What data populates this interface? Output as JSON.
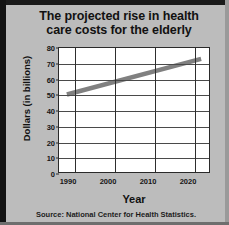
{
  "chart_data": {
    "type": "line",
    "title": "The projected rise in health care costs for the elderly",
    "title_line1": "The projected rise in health",
    "title_line2": "care costs for the elderly",
    "xlabel": "Year",
    "ylabel": "Dollars (in billions)",
    "source": "Source: National Center for Health Statistics.",
    "xlim": [
      1986,
      2024
    ],
    "ylim": [
      0,
      80
    ],
    "xticks": [
      1990,
      2000,
      2010,
      2020
    ],
    "xtick_labels": [
      "1990",
      "2000",
      "2010",
      "2020"
    ],
    "yticks": [
      0,
      10,
      20,
      30,
      40,
      50,
      60,
      70,
      80
    ],
    "ytick_labels": [
      "0",
      "10",
      "20",
      "30",
      "40",
      "50",
      "60",
      "70",
      "80"
    ],
    "grid": true,
    "legend": "none",
    "series": [
      {
        "name": "Projected health care costs for the elderly",
        "color": "#808080",
        "x": [
          1988,
          2022
        ],
        "values": [
          50,
          73
        ]
      }
    ]
  }
}
